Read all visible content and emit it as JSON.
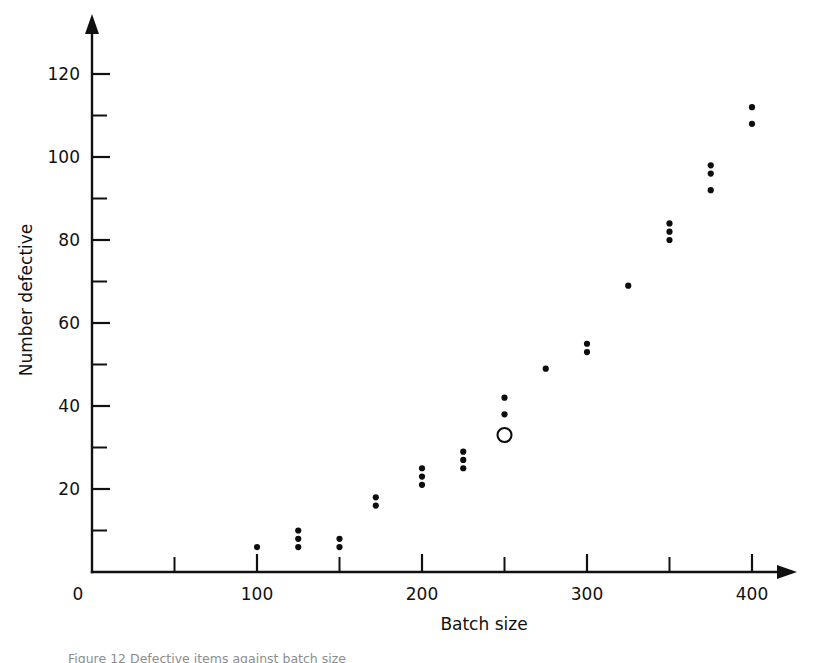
{
  "figure": {
    "caption_fragment": "Figure 12  Defective items against batch size"
  },
  "chart_data": {
    "type": "scatter",
    "title": "",
    "xlabel": "Batch size",
    "ylabel": "Number defective",
    "xlim": [
      0,
      420
    ],
    "ylim": [
      0,
      128
    ],
    "grid": false,
    "legend": "none",
    "x_ticks_major": [
      0,
      100,
      200,
      300,
      400
    ],
    "x_ticks_minor": [
      50,
      150,
      250,
      350
    ],
    "x_tick_labels": [
      "0",
      "100",
      "200",
      "300",
      "400"
    ],
    "y_ticks_major": [
      20,
      40,
      60,
      80,
      100,
      120
    ],
    "y_ticks_minor": [
      10,
      30,
      50,
      70,
      90,
      110
    ],
    "y_tick_labels": [
      "20",
      "40",
      "60",
      "80",
      "100",
      "120"
    ],
    "y_origin_label": "0",
    "series": [
      {
        "name": "observations",
        "marker": "filled-circle",
        "color": "#0d0d0d",
        "points": [
          [
            100,
            6
          ],
          [
            125,
            10
          ],
          [
            125,
            8
          ],
          [
            125,
            6
          ],
          [
            150,
            8
          ],
          [
            150,
            6
          ],
          [
            172,
            18
          ],
          [
            172,
            16
          ],
          [
            200,
            25
          ],
          [
            200,
            23
          ],
          [
            200,
            21
          ],
          [
            225,
            29
          ],
          [
            225,
            27
          ],
          [
            225,
            25
          ],
          [
            250,
            42
          ],
          [
            250,
            38
          ],
          [
            275,
            49
          ],
          [
            300,
            55
          ],
          [
            300,
            53
          ],
          [
            325,
            69
          ],
          [
            350,
            84
          ],
          [
            350,
            82
          ],
          [
            350,
            80
          ],
          [
            375,
            98
          ],
          [
            375,
            96
          ],
          [
            375,
            92
          ],
          [
            400,
            112
          ],
          [
            400,
            108
          ]
        ]
      },
      {
        "name": "highlighted-observation",
        "marker": "open-circle",
        "color": "#0d0d0d",
        "points": [
          [
            250,
            33
          ]
        ]
      }
    ]
  }
}
